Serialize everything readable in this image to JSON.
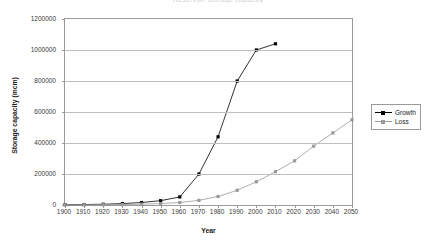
{
  "chart_data": {
    "type": "line",
    "title": "Reservoir storage capacity",
    "xlabel": "Year",
    "ylabel": "Storage capacity (mcm)",
    "xlim": [
      1900,
      2050
    ],
    "ylim": [
      0,
      1200000
    ],
    "xticks": [
      1900,
      1910,
      1920,
      1930,
      1940,
      1950,
      1960,
      1970,
      1980,
      1990,
      2000,
      2010,
      2020,
      2030,
      2040,
      2050
    ],
    "yticks": [
      0,
      200000,
      400000,
      600000,
      800000,
      1000000,
      1200000
    ],
    "grid": "horizontal",
    "legend_position": "right",
    "series": [
      {
        "name": "Growth",
        "color": "#000000",
        "marker": "square",
        "x": [
          1900,
          1910,
          1920,
          1930,
          1940,
          1950,
          1960,
          1970,
          1980,
          1990,
          2000,
          2010
        ],
        "values": [
          2000,
          3000,
          5000,
          9000,
          16000,
          28000,
          52000,
          200000,
          440000,
          800000,
          1000000,
          1040000
        ]
      },
      {
        "name": "Loss",
        "color": "#9a9a9a",
        "marker": "square",
        "x": [
          1900,
          1910,
          1920,
          1930,
          1940,
          1950,
          1960,
          1970,
          1980,
          1990,
          2000,
          2010,
          2020,
          2030,
          2040,
          2050
        ],
        "values": [
          1000,
          1500,
          2000,
          3000,
          5000,
          9000,
          16000,
          30000,
          55000,
          95000,
          150000,
          215000,
          285000,
          380000,
          465000,
          550000
        ]
      }
    ]
  },
  "legend": {
    "items": [
      {
        "label": "Growth"
      },
      {
        "label": "Loss"
      }
    ]
  }
}
